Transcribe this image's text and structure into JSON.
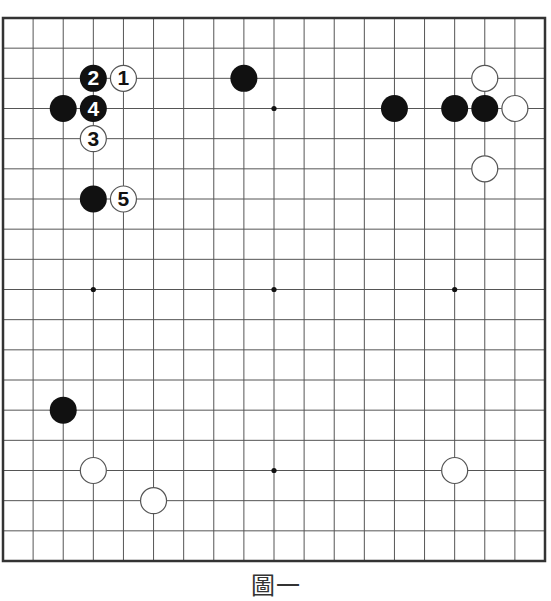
{
  "diagram": {
    "type": "go-board",
    "size": 19,
    "caption": "圖一",
    "colors": {
      "background": "#ffffff",
      "grid_line": "#555555",
      "border": "#333333",
      "black_stone": "#111111",
      "white_stone": "#ffffff",
      "white_stone_outline": "#555555"
    },
    "star_points_visible": [
      [
        9,
        3
      ],
      [
        3,
        9
      ],
      [
        9,
        9
      ],
      [
        15,
        9
      ],
      [
        9,
        15
      ]
    ],
    "stones": [
      {
        "color": "black",
        "col": 8,
        "row": 2,
        "label": ""
      },
      {
        "color": "black",
        "col": 2,
        "row": 3,
        "label": ""
      },
      {
        "color": "black",
        "col": 3,
        "row": 6,
        "label": ""
      },
      {
        "color": "black",
        "col": 13,
        "row": 3,
        "label": ""
      },
      {
        "color": "black",
        "col": 15,
        "row": 3,
        "label": ""
      },
      {
        "color": "black",
        "col": 16,
        "row": 3,
        "label": ""
      },
      {
        "color": "black",
        "col": 2,
        "row": 13,
        "label": ""
      },
      {
        "color": "white",
        "col": 16,
        "row": 2,
        "label": ""
      },
      {
        "color": "white",
        "col": 17,
        "row": 3,
        "label": ""
      },
      {
        "color": "white",
        "col": 16,
        "row": 5,
        "label": ""
      },
      {
        "color": "white",
        "col": 3,
        "row": 15,
        "label": ""
      },
      {
        "color": "white",
        "col": 5,
        "row": 16,
        "label": ""
      },
      {
        "color": "white",
        "col": 15,
        "row": 15,
        "label": ""
      },
      {
        "color": "white",
        "col": 4,
        "row": 2,
        "label": "1"
      },
      {
        "color": "black",
        "col": 3,
        "row": 2,
        "label": "2"
      },
      {
        "color": "white",
        "col": 3,
        "row": 4,
        "label": "3"
      },
      {
        "color": "black",
        "col": 3,
        "row": 3,
        "label": "4"
      },
      {
        "color": "white",
        "col": 4,
        "row": 6,
        "label": "5"
      }
    ]
  }
}
